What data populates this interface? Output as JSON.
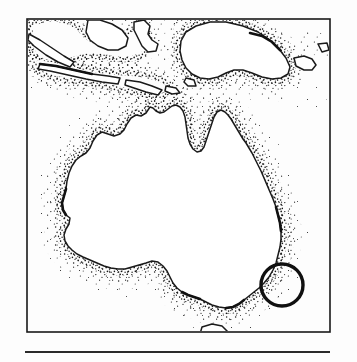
{
  "figure": {
    "kind": "line-art-map",
    "title": "Map of Australia and the Indonesian archipelago",
    "background_color": "#fdfdfd",
    "ink_color": "#1a1a1a",
    "style_note": "black and white stippled coastal shading"
  },
  "frame": {
    "name": "map-border",
    "x": 27,
    "y": 19,
    "width": 303,
    "height": 313,
    "stroke_color": "#1a1a1a",
    "stroke_width": 1.6
  },
  "rule": {
    "name": "caption-rule",
    "x": 25,
    "y": 351,
    "width": 305,
    "height": 2,
    "color": "#2b2b2b"
  },
  "landmasses": [
    {
      "name": "australia",
      "label": "Australia"
    },
    {
      "name": "new-guinea",
      "label": "New Guinea"
    },
    {
      "name": "java",
      "label": "Java"
    },
    {
      "name": "sumatra",
      "label": "Sumatra"
    },
    {
      "name": "borneo",
      "label": "Borneo"
    },
    {
      "name": "sulawesi",
      "label": "Sulawesi"
    },
    {
      "name": "timor",
      "label": "Timor"
    },
    {
      "name": "tasmania",
      "label": "Tasmania"
    },
    {
      "name": "new-britain",
      "label": "New Britain"
    }
  ],
  "annotation": {
    "name": "location-circle",
    "shape": "circle",
    "cx": 282,
    "cy": 285,
    "r": 21,
    "stroke_color": "#101010",
    "stroke_width": 3.4,
    "fill": "none",
    "description": "hand drawn circle marking a site on the south-east coast"
  },
  "stipple": {
    "name": "coastal-stipple",
    "dot_color": "#1a1a1a",
    "description": "dense dot shading on the seaward side of coastlines"
  }
}
